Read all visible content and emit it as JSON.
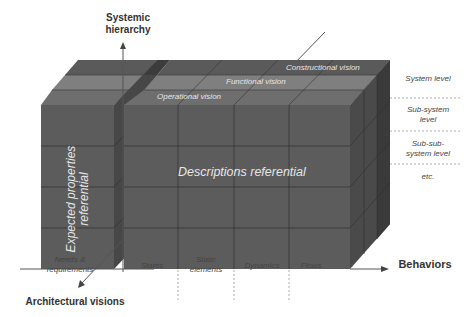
{
  "axes": {
    "vertical": {
      "label": "Systemic\nhierarchy",
      "line1": "Systemic",
      "line2": "hierarchy"
    },
    "horizontal": {
      "label": "Behaviors"
    },
    "diagonal": {
      "label": "Architectural visions"
    }
  },
  "referentials": {
    "left": {
      "line1": "Expected properties",
      "line2": "referential"
    },
    "main": {
      "label": "Descriptions referential"
    }
  },
  "visions": [
    {
      "label": "Operational vision"
    },
    {
      "label": "Functional vision"
    },
    {
      "label": "Constructional vision"
    }
  ],
  "levels": [
    {
      "line1": "System level",
      "line2": ""
    },
    {
      "line1": "Sub-system",
      "line2": "level"
    },
    {
      "line1": "Sub-sub-",
      "line2": "system level"
    },
    {
      "line1": "etc.",
      "line2": ""
    }
  ],
  "behaviors": [
    {
      "line1": "Needs &",
      "line2": "requirements"
    },
    {
      "line1": "States",
      "line2": ""
    },
    {
      "line1": "Static",
      "line2": "elements"
    },
    {
      "line1": "Dynamics",
      "line2": ""
    },
    {
      "line1": "Flows",
      "line2": ""
    }
  ],
  "colors": {
    "front_face": "#5c5c5c",
    "top_band_front": "#6e6e6e",
    "top_band_mid": "#7f7f7f",
    "top_band_back": "#5a5a5a",
    "side_face": "#454545",
    "grid_line": "#2f2f2f",
    "axis_line": "#555555",
    "dashed_line": "#9a9a9a"
  }
}
